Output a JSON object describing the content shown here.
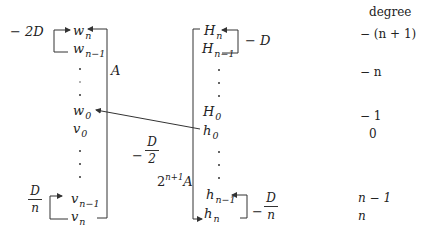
{
  "header": {
    "degree_label": "degree"
  },
  "left_column": {
    "items": [
      {
        "base": "w",
        "sub": "n"
      },
      {
        "base": "w",
        "sub": "n−1"
      },
      {
        "base": "w",
        "sub": "0"
      },
      {
        "base": "v",
        "sub": "0"
      },
      {
        "base": "v",
        "sub": "n−1"
      },
      {
        "base": "v",
        "sub": "n"
      }
    ],
    "top_loop_label": "− 2D",
    "bottom_loop_label": {
      "num": "D",
      "den": "n"
    },
    "side_label": "A"
  },
  "right_column": {
    "items": [
      {
        "base": "H",
        "sub": "n"
      },
      {
        "base": "H",
        "sub": "n−1"
      },
      {
        "base": "H",
        "sub": "0"
      },
      {
        "base": "h",
        "sub": "0"
      },
      {
        "base": "h",
        "sub": "n−1"
      },
      {
        "base": "h",
        "sub": "n"
      }
    ],
    "top_loop_label": "− D",
    "bottom_loop_label": {
      "sign": "−",
      "num": "D",
      "den": "n"
    },
    "side_label": {
      "base": "2",
      "sup": "n+1",
      "tail": "A"
    }
  },
  "cross_arrow": {
    "sign": "−",
    "num": "D",
    "den": "2"
  },
  "degrees": [
    "− (n + 1)",
    "− n",
    "− 1",
    "0",
    "n − 1",
    "n"
  ],
  "colors": {
    "ink": "#222222",
    "background": "#ffffff"
  }
}
